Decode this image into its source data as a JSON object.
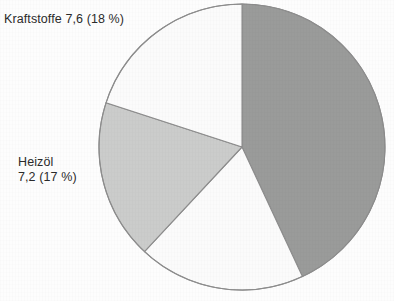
{
  "page": {
    "background_color": "#fdfdfd",
    "width": 394,
    "height": 301
  },
  "chart_data": {
    "type": "pie",
    "title": "",
    "subtitle": "",
    "xlabel": "",
    "ylabel": "",
    "legend_position": "none",
    "grid": false,
    "units": "Mio. t",
    "start_angle_deg": 0,
    "direction": "clockwise",
    "center": {
      "x": 242,
      "y": 147
    },
    "radius": 143,
    "outline_color": "#8d8d8d",
    "categories": [
      "unlabeled-dark",
      "unlabeled-bottom",
      "Heizöl",
      "Kraftstoffe"
    ],
    "values": [
      18.6,
      8.0,
      7.2,
      7.6
    ],
    "percents": [
      47,
      18,
      17,
      18
    ],
    "slices": [
      {
        "name": "unlabeled-dark",
        "label": "",
        "value": 18.6,
        "percent": 47,
        "start_deg": 0,
        "end_deg": 155,
        "color": "#9a9b9a",
        "labeled": false
      },
      {
        "name": "unlabeled-bottom",
        "label": "",
        "value": 8.0,
        "percent": 18,
        "start_deg": 155,
        "end_deg": 223,
        "color": "#fbfbfb",
        "labeled": false
      },
      {
        "name": "Heizöl",
        "label": "Heizöl 7,2 (17 %)",
        "value": 7.2,
        "percent": 17,
        "start_deg": 223,
        "end_deg": 288,
        "color": "#cbcccb",
        "labeled": true
      },
      {
        "name": "Kraftstoffe",
        "label": "Kraftstoffe 7,6 (18 %)",
        "value": 7.6,
        "percent": 18,
        "start_deg": 288,
        "end_deg": 360,
        "color": "#fbfbfb",
        "labeled": true
      }
    ],
    "annotations": [
      {
        "name": "kraftstoffe",
        "text": "Kraftstoffe 7,6 (18 %)",
        "x": 4,
        "y": 12
      },
      {
        "name": "heizoel",
        "text": "Heizöl 7,2 (17 %)",
        "x": 18,
        "y": 155
      },
      {
        "name": "bottom-clipped",
        "text": "",
        "x": 104,
        "y": 293
      }
    ]
  },
  "labels": {
    "kraftstoffe": "Kraftstoffe 7,6 (18 %)",
    "heizoel_line1": "Heizöl",
    "heizoel_line2": "7,2 (17 %)",
    "bottom_clipped": ""
  }
}
